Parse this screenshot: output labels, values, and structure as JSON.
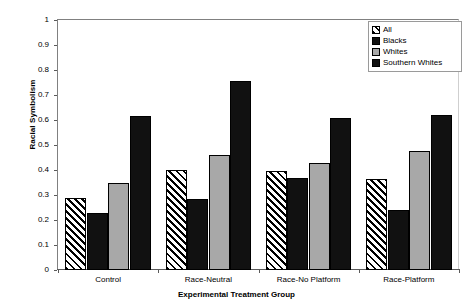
{
  "chart_data": {
    "type": "bar",
    "title": "",
    "xlabel": "Experimental Treatment Group",
    "ylabel": "Racial Symbolism",
    "ylim": [
      0,
      1
    ],
    "ytick_labels": [
      "0",
      "0.1",
      "0.2",
      "0.3",
      "0.4",
      "0.5",
      "0.6",
      "0.7",
      "0.8",
      "0.9",
      "1"
    ],
    "ytick_values": [
      0,
      0.1,
      0.2,
      0.3,
      0.4,
      0.5,
      0.6,
      0.7,
      0.8,
      0.9,
      1
    ],
    "grid": false,
    "legend_position": "top-right",
    "categories": [
      "Control",
      "Race-Neutral",
      "Race-No Platform",
      "Race-Platform"
    ],
    "series": [
      {
        "name": "All",
        "fill": "diagonal-hatch",
        "values": [
          0.29,
          0.4,
          0.395,
          0.365
        ]
      },
      {
        "name": "Blacks",
        "fill": "#111111",
        "values": [
          0.23,
          0.285,
          0.37,
          0.24
        ]
      },
      {
        "name": "Whites",
        "fill": "#a8a8a8",
        "values": [
          0.35,
          0.46,
          0.43,
          0.475
        ]
      },
      {
        "name": "Southern Whites",
        "fill": "#111111",
        "values": [
          0.615,
          0.755,
          0.61,
          0.62
        ]
      }
    ]
  },
  "legend": {
    "items": [
      {
        "label": "All"
      },
      {
        "label": "Blacks"
      },
      {
        "label": "Whites"
      },
      {
        "label": "Southern Whites"
      }
    ]
  }
}
